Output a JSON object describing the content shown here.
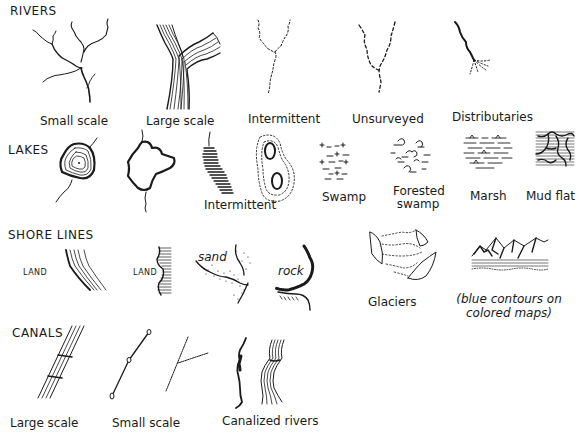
{
  "sections": {
    "rivers": {
      "title": "RIVERS",
      "items": [
        {
          "label": "Small scale",
          "icon": "river-small-scale"
        },
        {
          "label": "Large scale",
          "icon": "river-large-scale"
        },
        {
          "label": "Intermittent",
          "icon": "river-intermittent"
        },
        {
          "label": "Unsurveyed",
          "icon": "river-unsurveyed"
        },
        {
          "label": "Distributaries",
          "icon": "river-distributaries"
        }
      ]
    },
    "lakes": {
      "title": "LAKES",
      "items": [
        {
          "label": "",
          "icon": "lake-small-scale"
        },
        {
          "label": "",
          "icon": "lake-large-scale"
        },
        {
          "label": "Intermittent",
          "icon": "lake-intermittent"
        },
        {
          "label": "Swamp",
          "icon": "swamp"
        },
        {
          "label_line1": "Forested",
          "label_line2": "swamp",
          "icon": "forested-swamp"
        },
        {
          "label": "Marsh",
          "icon": "marsh"
        },
        {
          "label": "Mud flat",
          "icon": "mud-flat"
        }
      ]
    },
    "shore_lines": {
      "title": "SHORE LINES",
      "items": [
        {
          "label": "LAND",
          "icon": "shoreline-contoured"
        },
        {
          "label": "LAND",
          "icon": "shoreline-hachured"
        },
        {
          "label": "sand",
          "icon": "shoreline-sand"
        },
        {
          "label": "rock",
          "icon": "shoreline-rock"
        }
      ]
    },
    "glaciers": {
      "items": [
        {
          "label": "Glaciers",
          "icon": "glacier-contours"
        },
        {
          "label_line1": "(blue contours on",
          "label_line2": "colored maps)",
          "icon": "glacier-relief"
        }
      ]
    },
    "canals": {
      "title": "CANALS",
      "items": [
        {
          "label": "Large scale",
          "icon": "canal-large-scale"
        },
        {
          "label": "Small scale",
          "icon": "canal-small-scale"
        },
        {
          "label": "Canalized rivers",
          "icon": "canalized-rivers"
        }
      ]
    }
  },
  "colors": {
    "ink": "#1a1a1a",
    "background": "#ffffff"
  }
}
